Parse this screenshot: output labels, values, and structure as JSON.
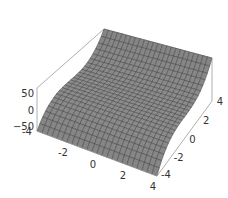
{
  "chart_data": {
    "type": "surface3d",
    "title": "",
    "function": "z = y^3",
    "x_range": [
      -4,
      4
    ],
    "y_range": [
      -4,
      4
    ],
    "z_range": [
      -64,
      64
    ],
    "grid_resolution": 24,
    "x_ticks": [
      -4,
      -2,
      0,
      2,
      4
    ],
    "y_ticks": [
      -4,
      -2,
      0,
      2,
      4
    ],
    "z_ticks": [
      50,
      0,
      -50
    ],
    "x_tick_labels": [
      "-4",
      "-2",
      "0",
      "2",
      "4"
    ],
    "y_tick_labels": [
      "-4",
      "-2",
      "0",
      "2",
      "4"
    ],
    "z_tick_labels": [
      "50",
      "0",
      "−50"
    ],
    "xlabel": "",
    "ylabel": "",
    "zlabel": "",
    "box": true,
    "surface_color": "#8c8c8c",
    "mesh_color": "#3a3a3a",
    "box_color": "#9a9a9a"
  }
}
